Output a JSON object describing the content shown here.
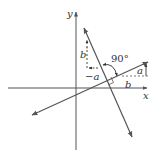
{
  "diagram": {
    "type": "perpendicular-lines-slope",
    "labels": {
      "x_axis": "x",
      "y_axis": "y",
      "angle": "90°",
      "rise": "a",
      "run": "b",
      "perp_rise": "b",
      "perp_run": "−a"
    },
    "colors": {
      "line": "#555555",
      "text": "#333333",
      "background": "#ffffff"
    }
  }
}
